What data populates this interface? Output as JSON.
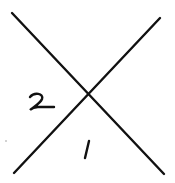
{
  "diagram": {
    "type": "hand-drawn crossing lines",
    "background": "#ffffff",
    "ink_color": "#111111",
    "lines": [
      {
        "id": "line-a",
        "from": [
          12,
          13
        ],
        "to": [
          164,
          174
        ]
      },
      {
        "id": "line-b",
        "from": [
          160,
          18
        ],
        "to": [
          14,
          173
        ]
      }
    ],
    "intersection": [
      86,
      96
    ],
    "regions": [
      {
        "id": "region-left",
        "label": "2",
        "position": [
          28,
          92
        ]
      },
      {
        "id": "region-bottom",
        "label": "1",
        "position": [
          82,
          139
        ]
      }
    ],
    "marks": [
      {
        "id": "speck",
        "position": [
          6,
          141
        ]
      }
    ]
  }
}
